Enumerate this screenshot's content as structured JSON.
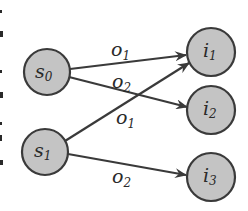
{
  "diagram": {
    "type": "bipartite-directed-graph",
    "colors": {
      "node_fill": "#c4c4c4",
      "stroke": "#3a3a3a",
      "text": "#2a2a2a",
      "background": "#ffffff"
    },
    "nodes": [
      {
        "id": "s0",
        "base": "s",
        "sub": "0",
        "cx": 47,
        "cy": 72,
        "r": 23
      },
      {
        "id": "s1",
        "base": "s",
        "sub": "1",
        "cx": 45,
        "cy": 152,
        "r": 23
      },
      {
        "id": "i1",
        "base": "i",
        "sub": "1",
        "cx": 211,
        "cy": 52,
        "r": 24
      },
      {
        "id": "i2",
        "base": "i",
        "sub": "2",
        "cx": 211,
        "cy": 110,
        "r": 24
      },
      {
        "id": "i3",
        "base": "i",
        "sub": "3",
        "cx": 211,
        "cy": 177,
        "r": 24
      }
    ],
    "edges": [
      {
        "from": "s0",
        "to": "i1",
        "label_base": "o",
        "label_sub": "1"
      },
      {
        "from": "s0",
        "to": "i2",
        "label_base": "o",
        "label_sub": "2"
      },
      {
        "from": "s1",
        "to": "i1",
        "label_base": "o",
        "label_sub": "1"
      },
      {
        "from": "s1",
        "to": "i3",
        "label_base": "o",
        "label_sub": "2"
      }
    ]
  }
}
